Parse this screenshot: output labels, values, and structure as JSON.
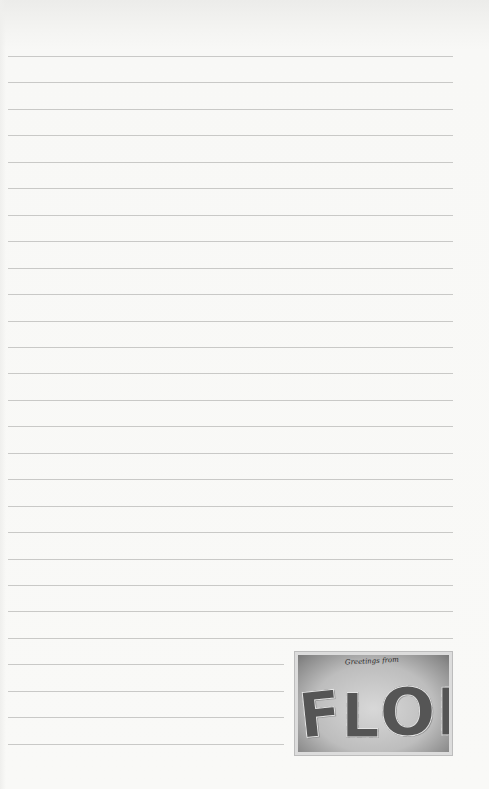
{
  "page": {
    "type": "lined-notepaper",
    "background_color": "#f8f8f6",
    "rule_color": "#c9c9c7"
  },
  "rules": {
    "full_count": 23,
    "short_count": 4,
    "first_top_px": 56,
    "spacing_px": 26.45
  },
  "postcard": {
    "greeting": "Greetings from",
    "letters": [
      "F",
      "L",
      "O",
      "R",
      "I",
      "D",
      "A"
    ],
    "word": "FLORIDA",
    "tone": "grayscale"
  }
}
